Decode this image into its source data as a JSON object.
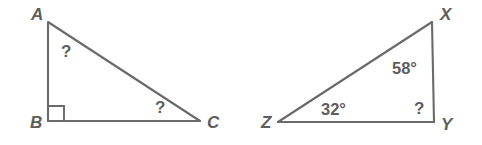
{
  "figure": {
    "type": "geometry-diagram",
    "stroke_color": "#6a6a6a",
    "text_color": "#5e5e5e",
    "background_color": "#ffffff",
    "triangles": [
      {
        "name": "triangle-abc",
        "vertices": [
          {
            "id": "A",
            "label": "A",
            "x": 48,
            "y": 22,
            "label_x": 31,
            "label_y": 20
          },
          {
            "id": "B",
            "label": "B",
            "x": 48,
            "y": 121,
            "label_x": 30,
            "label_y": 128
          },
          {
            "id": "C",
            "label": "C",
            "x": 200,
            "y": 121,
            "label_x": 207,
            "label_y": 128
          }
        ],
        "right_angle_at": "B",
        "angles": [
          {
            "at": "A",
            "value": "?",
            "x": 61,
            "y": 57
          },
          {
            "at": "C",
            "value": "?",
            "x": 155,
            "y": 113
          }
        ]
      },
      {
        "name": "triangle-xyz",
        "vertices": [
          {
            "id": "X",
            "label": "X",
            "x": 432,
            "y": 22,
            "label_x": 440,
            "label_y": 20
          },
          {
            "id": "Y",
            "label": "Y",
            "x": 434,
            "y": 122,
            "label_x": 441,
            "label_y": 130
          },
          {
            "id": "Z",
            "label": "Z",
            "x": 278,
            "y": 122,
            "label_x": 261,
            "label_y": 128
          }
        ],
        "right_angle_at": "Y",
        "angles": [
          {
            "at": "X",
            "value": "58°",
            "x": 392,
            "y": 74
          },
          {
            "at": "Z",
            "value": "32°",
            "x": 321,
            "y": 115
          },
          {
            "at": "Y",
            "value": "?",
            "x": 414,
            "y": 114
          }
        ]
      }
    ]
  }
}
